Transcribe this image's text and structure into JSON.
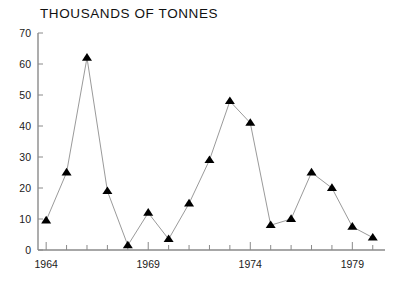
{
  "chart_data": {
    "type": "line",
    "title": "THOUSANDS OF TONNES",
    "xlabel": "",
    "ylabel": "",
    "xlim": [
      1963.6,
      1980.6
    ],
    "ylim": [
      0,
      70
    ],
    "ytick_step": 10,
    "yticks": [
      0,
      10,
      20,
      30,
      40,
      50,
      60,
      70
    ],
    "ytick_labels": [
      "0",
      "10",
      "20",
      "30",
      "40",
      "50",
      "60",
      "70"
    ],
    "xticks": [
      1964,
      1965,
      1966,
      1967,
      1968,
      1969,
      1970,
      1971,
      1972,
      1973,
      1974,
      1975,
      1976,
      1977,
      1978,
      1979,
      1980
    ],
    "xtick_labels_major": [
      "1964",
      "1969",
      "1974",
      "1979"
    ],
    "xticks_major": [
      1964,
      1969,
      1974,
      1979
    ],
    "grid": false,
    "legend": false,
    "marker": "triangle-up",
    "marker_color": "#000000",
    "line_color": "#9a9a9a",
    "x": [
      1964,
      1965,
      1966,
      1967,
      1968,
      1969,
      1970,
      1971,
      1972,
      1973,
      1974,
      1975,
      1976,
      1977,
      1978,
      1979,
      1980
    ],
    "values": [
      9.5,
      25,
      62,
      19,
      1.5,
      12,
      3.5,
      15,
      29,
      48,
      41,
      8,
      10,
      25,
      20,
      7.5,
      4
    ],
    "series": [
      {
        "name": "Tonnes",
        "x": [
          1964,
          1965,
          1966,
          1967,
          1968,
          1969,
          1970,
          1971,
          1972,
          1973,
          1974,
          1975,
          1976,
          1977,
          1978,
          1979,
          1980
        ],
        "values": [
          9.5,
          25,
          62,
          19,
          1.5,
          12,
          3.5,
          15,
          29,
          48,
          41,
          8,
          10,
          25,
          20,
          7.5,
          4
        ]
      }
    ]
  },
  "axes": {
    "x_label_1": "1964",
    "x_label_2": "1969",
    "x_label_3": "1974",
    "x_label_4": "1979"
  }
}
